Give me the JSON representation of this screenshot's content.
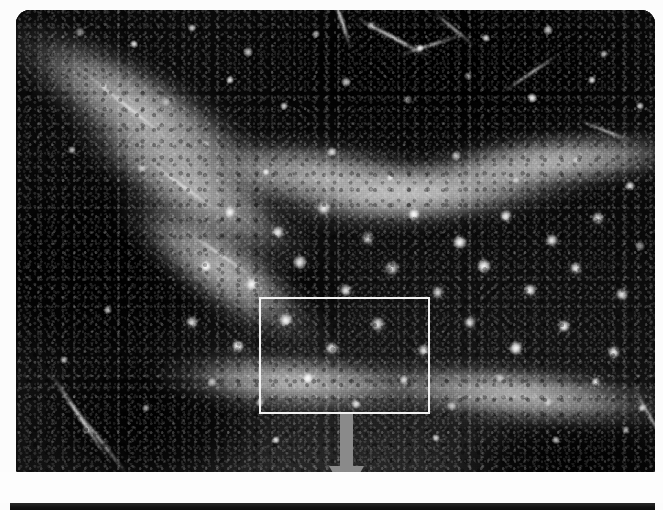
{
  "figure": {
    "kind": "photomicrograph-panel",
    "modality": "fluorescence / immunohistochemistry",
    "color_mode": "grayscale",
    "region_depicted": "hippocampal dentate gyrus",
    "panel_count_visible": 2
  },
  "main_panel": {
    "name": "main-micrograph",
    "x": 16,
    "y": 10,
    "width": 639,
    "height": 462,
    "corner_radius_px": 14,
    "background_color": "#0b0b0b",
    "bright_tone_color": "#bababa",
    "mid_tone_color": "#6e6e6e",
    "alt_text": "Dark grayscale micrograph of hippocampal dentate gyrus showing a V-shaped mid-gray granule cell layer and numerous small bright star-shaped labelled cells scattered through the hilus."
  },
  "roi_box": {
    "name": "inset-region-of-interest",
    "label": "",
    "x": 259,
    "y": 297,
    "width": 171,
    "height": 117,
    "stroke_color": "#f2f2f2",
    "stroke_width_px": 2.5
  },
  "arrow": {
    "name": "magnification-pointer",
    "direction": "down",
    "color": "#8a8a8a",
    "x": 326,
    "y": 414,
    "width": 41,
    "height": 85,
    "shaft_width_px": 13,
    "head_width_px": 38
  },
  "gutter": {
    "name": "white-gutter",
    "y": 472,
    "height": 31,
    "color": "#fdfdfd",
    "ghost_text": "▮ ▯▮▯ ▮▯ ▮▯▮ ▯▮ ▮▯▮▯ ▯▮ ▮▯ ▮▯▮ ▯▮▯ ▮▯ ▮▯▮ ▯▮▯▮"
  },
  "next_panel": {
    "name": "next-micrograph-top-edge",
    "x": 10,
    "y": 503,
    "width": 645,
    "height": 7,
    "color": "#121212"
  },
  "cells": [
    {
      "x": 64,
      "y": 22,
      "r": 5
    },
    {
      "x": 118,
      "y": 34,
      "r": 4
    },
    {
      "x": 176,
      "y": 18,
      "r": 4
    },
    {
      "x": 232,
      "y": 42,
      "r": 5
    },
    {
      "x": 300,
      "y": 24,
      "r": 4
    },
    {
      "x": 356,
      "y": 16,
      "r": 5
    },
    {
      "x": 404,
      "y": 38,
      "r": 4
    },
    {
      "x": 470,
      "y": 28,
      "r": 4
    },
    {
      "x": 532,
      "y": 20,
      "r": 5
    },
    {
      "x": 588,
      "y": 44,
      "r": 4
    },
    {
      "x": 88,
      "y": 76,
      "r": 4
    },
    {
      "x": 150,
      "y": 92,
      "r": 5
    },
    {
      "x": 214,
      "y": 70,
      "r": 4
    },
    {
      "x": 268,
      "y": 96,
      "r": 4
    },
    {
      "x": 330,
      "y": 72,
      "r": 5
    },
    {
      "x": 392,
      "y": 90,
      "r": 4
    },
    {
      "x": 452,
      "y": 66,
      "r": 4
    },
    {
      "x": 516,
      "y": 88,
      "r": 5
    },
    {
      "x": 576,
      "y": 70,
      "r": 4
    },
    {
      "x": 624,
      "y": 96,
      "r": 4
    },
    {
      "x": 56,
      "y": 140,
      "r": 4
    },
    {
      "x": 126,
      "y": 158,
      "r": 5
    },
    {
      "x": 190,
      "y": 134,
      "r": 4
    },
    {
      "x": 250,
      "y": 162,
      "r": 4
    },
    {
      "x": 316,
      "y": 142,
      "r": 5
    },
    {
      "x": 374,
      "y": 168,
      "r": 4
    },
    {
      "x": 440,
      "y": 146,
      "r": 5
    },
    {
      "x": 500,
      "y": 170,
      "r": 4
    },
    {
      "x": 560,
      "y": 150,
      "r": 4
    },
    {
      "x": 614,
      "y": 176,
      "r": 5
    },
    {
      "x": 214,
      "y": 202,
      "r": 6
    },
    {
      "x": 262,
      "y": 222,
      "r": 6
    },
    {
      "x": 308,
      "y": 198,
      "r": 7
    },
    {
      "x": 352,
      "y": 228,
      "r": 6
    },
    {
      "x": 398,
      "y": 204,
      "r": 6
    },
    {
      "x": 444,
      "y": 232,
      "r": 7
    },
    {
      "x": 490,
      "y": 206,
      "r": 6
    },
    {
      "x": 536,
      "y": 230,
      "r": 6
    },
    {
      "x": 582,
      "y": 208,
      "r": 6
    },
    {
      "x": 624,
      "y": 236,
      "r": 5
    },
    {
      "x": 190,
      "y": 256,
      "r": 6
    },
    {
      "x": 236,
      "y": 274,
      "r": 7
    },
    {
      "x": 284,
      "y": 252,
      "r": 7
    },
    {
      "x": 330,
      "y": 280,
      "r": 6
    },
    {
      "x": 376,
      "y": 258,
      "r": 7
    },
    {
      "x": 422,
      "y": 282,
      "r": 6
    },
    {
      "x": 468,
      "y": 256,
      "r": 7
    },
    {
      "x": 514,
      "y": 280,
      "r": 6
    },
    {
      "x": 560,
      "y": 258,
      "r": 6
    },
    {
      "x": 606,
      "y": 284,
      "r": 6
    },
    {
      "x": 176,
      "y": 312,
      "r": 6
    },
    {
      "x": 222,
      "y": 336,
      "r": 6
    },
    {
      "x": 270,
      "y": 310,
      "r": 7
    },
    {
      "x": 316,
      "y": 338,
      "r": 6
    },
    {
      "x": 362,
      "y": 314,
      "r": 7
    },
    {
      "x": 408,
      "y": 340,
      "r": 6
    },
    {
      "x": 454,
      "y": 312,
      "r": 6
    },
    {
      "x": 500,
      "y": 338,
      "r": 7
    },
    {
      "x": 548,
      "y": 316,
      "r": 6
    },
    {
      "x": 598,
      "y": 342,
      "r": 6
    },
    {
      "x": 196,
      "y": 372,
      "r": 5
    },
    {
      "x": 244,
      "y": 392,
      "r": 5
    },
    {
      "x": 292,
      "y": 368,
      "r": 6
    },
    {
      "x": 340,
      "y": 394,
      "r": 5
    },
    {
      "x": 388,
      "y": 370,
      "r": 5
    },
    {
      "x": 436,
      "y": 396,
      "r": 5
    },
    {
      "x": 484,
      "y": 368,
      "r": 5
    },
    {
      "x": 532,
      "y": 392,
      "r": 5
    },
    {
      "x": 580,
      "y": 372,
      "r": 5
    },
    {
      "x": 626,
      "y": 398,
      "r": 4
    },
    {
      "x": 92,
      "y": 300,
      "r": 4
    },
    {
      "x": 48,
      "y": 350,
      "r": 4
    },
    {
      "x": 130,
      "y": 398,
      "r": 4
    },
    {
      "x": 70,
      "y": 420,
      "r": 4
    },
    {
      "x": 260,
      "y": 430,
      "r": 4
    },
    {
      "x": 420,
      "y": 428,
      "r": 4
    },
    {
      "x": 540,
      "y": 430,
      "r": 4
    },
    {
      "x": 610,
      "y": 420,
      "r": 4
    }
  ],
  "fibres": [
    {
      "x": 296,
      "y": 10,
      "w": 60,
      "h": 3,
      "rot": 72
    },
    {
      "x": 332,
      "y": 26,
      "w": 90,
      "h": 3,
      "rot": 28
    },
    {
      "x": 380,
      "y": 34,
      "w": 70,
      "h": 2,
      "rot": -18
    },
    {
      "x": 410,
      "y": 18,
      "w": 56,
      "h": 2,
      "rot": 40
    },
    {
      "x": 52,
      "y": 96,
      "w": 120,
      "h": 2,
      "rot": 38
    },
    {
      "x": 118,
      "y": 176,
      "w": 100,
      "h": 2,
      "rot": 36
    },
    {
      "x": 160,
      "y": 244,
      "w": 90,
      "h": 2,
      "rot": 34
    },
    {
      "x": 8,
      "y": 404,
      "w": 110,
      "h": 3,
      "rot": 56
    },
    {
      "x": 40,
      "y": 430,
      "w": 90,
      "h": 2,
      "rot": 52
    },
    {
      "x": 480,
      "y": 62,
      "w": 70,
      "h": 2,
      "rot": -34
    },
    {
      "x": 560,
      "y": 120,
      "w": 60,
      "h": 2,
      "rot": 22
    },
    {
      "x": 598,
      "y": 404,
      "w": 70,
      "h": 2,
      "rot": 60
    }
  ]
}
